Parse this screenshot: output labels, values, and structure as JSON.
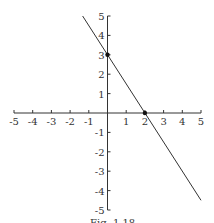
{
  "chart_data": {
    "type": "line",
    "title": "",
    "xlabel": "",
    "ylabel": "",
    "xlim": [
      -5,
      5
    ],
    "ylim": [
      -5,
      5
    ],
    "grid": false,
    "x_ticks": [
      "-5",
      "-4",
      "-3",
      "-2",
      "-1",
      "1",
      "2",
      "3",
      "4",
      "5"
    ],
    "y_ticks": [
      "5",
      "4",
      "3",
      "2",
      "1",
      "-1",
      "-2",
      "-3",
      "-4",
      "-5"
    ],
    "series": [
      {
        "name": "line",
        "equation": "y = -1.5x + 3",
        "x": [
          -1.33,
          5
        ],
        "y": [
          5,
          -4.5
        ]
      }
    ],
    "points": [
      {
        "label": "y-intercept",
        "x": 0,
        "y": 3
      },
      {
        "label": "x-intercept",
        "x": 2,
        "y": 0
      }
    ],
    "caption": "Fig. 1.18"
  },
  "colors": {
    "line": "#333333",
    "axis": "#333333"
  }
}
